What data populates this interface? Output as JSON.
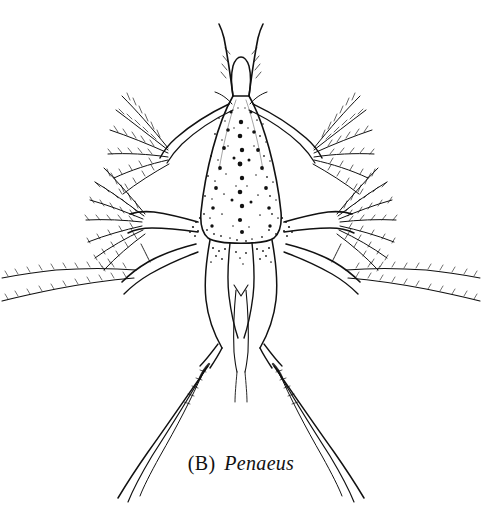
{
  "figure": {
    "domain": "natural-image",
    "style": "pen-and-ink stipple line drawing",
    "background_color": "#ffffff",
    "ink_color": "#111111",
    "canvas": {
      "width": 482,
      "height": 530
    }
  },
  "caption": {
    "panel_label": "(B)",
    "taxon_name": "Penaeus",
    "full_text": "(B) Penaeus",
    "font_style_label": "roman",
    "font_style_taxon": "italic",
    "position": {
      "x": 241,
      "y": 470
    }
  },
  "anatomy": {
    "parts": [
      {
        "name": "carapace",
        "description": "stippled triangular dorsal shield",
        "center": {
          "x": 241,
          "y": 180
        }
      },
      {
        "name": "rostrum",
        "description": "narrow anterior projection",
        "center": {
          "x": 241,
          "y": 95
        }
      },
      {
        "name": "antennule-left",
        "description": "long flagellum with plumose setae",
        "center": {
          "x": 228,
          "y": 60
        }
      },
      {
        "name": "antennule-right",
        "description": "long flagellum with plumose setae",
        "center": {
          "x": 256,
          "y": 60
        }
      },
      {
        "name": "antenna-left",
        "description": "biramous limb with setal fan",
        "center": {
          "x": 150,
          "y": 130
        }
      },
      {
        "name": "antenna-right",
        "description": "biramous limb with setal fan",
        "center": {
          "x": 332,
          "y": 130
        }
      },
      {
        "name": "maxilliped-left",
        "description": "large plumose setal fan",
        "center": {
          "x": 110,
          "y": 205
        }
      },
      {
        "name": "maxilliped-right",
        "description": "large plumose setal fan",
        "center": {
          "x": 372,
          "y": 205
        }
      },
      {
        "name": "pereiopod-left",
        "description": "long lateral limb with feathered setae",
        "center": {
          "x": 80,
          "y": 265
        }
      },
      {
        "name": "pereiopod-right",
        "description": "long lateral limb with feathered setae",
        "center": {
          "x": 402,
          "y": 265
        }
      },
      {
        "name": "abdomen",
        "description": "paired segmented posterior trunk",
        "center": {
          "x": 241,
          "y": 300
        }
      },
      {
        "name": "telson",
        "description": "forked tail with long caudal spines",
        "center": {
          "x": 241,
          "y": 400
        }
      }
    ]
  }
}
